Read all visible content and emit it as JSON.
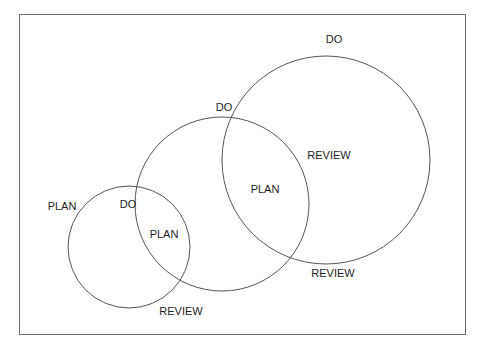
{
  "diagram": {
    "title": "",
    "circles": [
      {
        "name": "small-cycle",
        "cx": 129,
        "cy": 247,
        "r": 61
      },
      {
        "name": "medium-cycle",
        "cx": 222,
        "cy": 204,
        "r": 87
      },
      {
        "name": "large-cycle",
        "cx": 326,
        "cy": 160,
        "r": 104
      }
    ],
    "labels": {
      "do_large": "DO",
      "do_medium": "DO",
      "do_small": "DO",
      "plan_outer": "PLAN",
      "plan_small_inner": "PLAN",
      "plan_medium_inner": "PLAN",
      "review_large_inner": "REVIEW",
      "review_medium": "REVIEW",
      "review_small": "REVIEW"
    },
    "colors": {
      "stroke": "#555555",
      "border": "#6e6e6e",
      "text": "#1e1e1e",
      "background": "#ffffff"
    }
  }
}
